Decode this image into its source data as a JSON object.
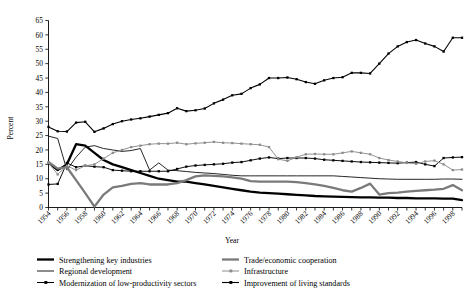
{
  "chart_data": {
    "type": "line",
    "title": "",
    "xlabel": "Year",
    "ylabel": "Percent",
    "ylim": [
      0,
      65
    ],
    "ytick_step": 5,
    "yticks": [
      0,
      5,
      10,
      15,
      20,
      25,
      30,
      35,
      40,
      45,
      50,
      55,
      60,
      65
    ],
    "xlim": [
      1954,
      1999
    ],
    "xticks": [
      1954,
      1956,
      1958,
      1960,
      1962,
      1964,
      1966,
      1968,
      1970,
      1972,
      1974,
      1976,
      1978,
      1980,
      1982,
      1984,
      1986,
      1988,
      1990,
      1992,
      1994,
      1996,
      1998
    ],
    "x": [
      1954,
      1955,
      1956,
      1957,
      1958,
      1959,
      1960,
      1961,
      1962,
      1963,
      1964,
      1965,
      1966,
      1967,
      1968,
      1969,
      1970,
      1971,
      1972,
      1973,
      1974,
      1975,
      1976,
      1977,
      1978,
      1979,
      1980,
      1981,
      1982,
      1983,
      1984,
      1985,
      1986,
      1987,
      1988,
      1989,
      1990,
      1991,
      1992,
      1993,
      1994,
      1995,
      1996,
      1997,
      1998,
      1999
    ],
    "grid": false,
    "legend_position": "bottom",
    "series": [
      {
        "name": "Strengthening key industries",
        "style": "thick-black",
        "color": "#000000",
        "width": 2.3,
        "marker": "none",
        "values": [
          15.5,
          13.0,
          15.0,
          22.0,
          21.5,
          19.0,
          16.5,
          15.0,
          14.0,
          13.0,
          12.0,
          11.0,
          10.0,
          9.5,
          9.0,
          9.0,
          8.5,
          8.0,
          7.5,
          7.0,
          6.5,
          6.0,
          5.5,
          5.2,
          5.0,
          4.8,
          4.6,
          4.4,
          4.2,
          4.0,
          3.9,
          3.8,
          3.7,
          3.6,
          3.5,
          3.5,
          3.4,
          3.4,
          3.3,
          3.3,
          3.2,
          3.2,
          3.2,
          3.1,
          3.1,
          2.6
        ]
      },
      {
        "name": "Regional development",
        "style": "thin-black",
        "color": "#1a1a1a",
        "width": 0.95,
        "marker": "none",
        "values": [
          24.8,
          24.0,
          13.0,
          17.5,
          21.0,
          21.5,
          20.5,
          20.0,
          19.5,
          19.8,
          20.5,
          13.0,
          15.5,
          13.0,
          12.8,
          12.5,
          12.2,
          12.0,
          11.8,
          11.5,
          11.2,
          11.0,
          11.0,
          11.0,
          11.0,
          11.0,
          11.0,
          11.0,
          11.0,
          11.0,
          11.0,
          11.0,
          10.8,
          10.6,
          10.4,
          10.2,
          10.0,
          9.9,
          9.8,
          9.8,
          9.8,
          9.8,
          9.8,
          9.9,
          9.9,
          9.8
        ]
      },
      {
        "name": "Modernization of low-productivity sectors",
        "style": "black-marker",
        "color": "#000000",
        "width": 0.95,
        "marker": "dot",
        "values": [
          8.0,
          8.2,
          15.5,
          14.0,
          14.5,
          14.2,
          14.0,
          13.0,
          12.8,
          12.6,
          12.6,
          12.6,
          12.6,
          12.6,
          13.4,
          14.2,
          14.6,
          14.8,
          15.0,
          15.2,
          15.6,
          15.8,
          16.4,
          17.0,
          17.4,
          17.0,
          17.2,
          17.2,
          17.2,
          17.0,
          16.6,
          16.4,
          16.2,
          16.0,
          15.8,
          15.7,
          15.6,
          15.5,
          15.4,
          15.6,
          15.8,
          15.0,
          14.4,
          17.2,
          17.4,
          17.5
        ]
      },
      {
        "name": "Trade/economic cooperation",
        "style": "thick-gray",
        "color": "#7a7a7a",
        "width": 2.3,
        "marker": "none",
        "values": [
          15.8,
          13.5,
          14.0,
          9.5,
          5.0,
          0.3,
          4.5,
          7.0,
          7.5,
          8.2,
          8.5,
          8.0,
          8.0,
          8.0,
          8.5,
          9.5,
          10.8,
          11.2,
          11.0,
          10.8,
          10.5,
          10.0,
          9.2,
          9.0,
          9.0,
          9.0,
          9.0,
          8.8,
          8.5,
          8.0,
          7.5,
          6.8,
          6.0,
          5.5,
          6.8,
          8.3,
          4.5,
          5.0,
          5.2,
          5.5,
          5.8,
          6.0,
          6.2,
          6.5,
          7.8,
          6.0
        ]
      },
      {
        "name": "Infrastructure",
        "style": "gray-marker",
        "color": "#8c8c8c",
        "width": 0.95,
        "marker": "dot",
        "values": [
          15.5,
          11.5,
          14.5,
          13.0,
          14.5,
          15.0,
          17.0,
          19.0,
          20.0,
          21.0,
          21.5,
          22.0,
          22.2,
          22.2,
          22.5,
          22.0,
          22.3,
          22.5,
          22.8,
          22.5,
          22.4,
          22.2,
          22.0,
          21.8,
          21.0,
          16.8,
          16.2,
          17.5,
          18.5,
          18.6,
          18.5,
          18.5,
          19.0,
          19.5,
          19.0,
          18.5,
          17.2,
          16.5,
          16.0,
          15.5,
          15.2,
          16.0,
          16.3,
          15.0,
          13.0,
          13.2
        ]
      },
      {
        "name": "Improvement of living standards",
        "style": "black-marker-thick",
        "color": "#000000",
        "width": 1.1,
        "marker": "dot",
        "values": [
          28.0,
          26.5,
          26.4,
          29.5,
          29.8,
          26.3,
          27.5,
          29.0,
          30.0,
          30.6,
          31.0,
          31.6,
          32.2,
          32.8,
          34.5,
          33.5,
          33.8,
          34.4,
          36.2,
          37.5,
          39.0,
          39.5,
          41.5,
          42.8,
          45.0,
          45.0,
          45.2,
          44.6,
          43.6,
          43.0,
          44.2,
          45.0,
          45.3,
          46.8,
          46.8,
          46.6,
          50.0,
          53.5,
          56.0,
          57.5,
          58.2,
          57.0,
          56.0,
          54.2,
          59.0,
          59.0
        ]
      }
    ]
  },
  "legend": {
    "entries": [
      {
        "label": "Strengthening key industries",
        "col": 0,
        "row": 0
      },
      {
        "label": "Regional development",
        "col": 0,
        "row": 1
      },
      {
        "label": "Modernization of low-productivity sectors",
        "col": 0,
        "row": 2
      },
      {
        "label": "Trade/economic cooperation",
        "col": 1,
        "row": 0
      },
      {
        "label": "Infrastructure",
        "col": 1,
        "row": 1
      },
      {
        "label": "Improvement of living standards",
        "col": 1,
        "row": 2
      }
    ]
  }
}
